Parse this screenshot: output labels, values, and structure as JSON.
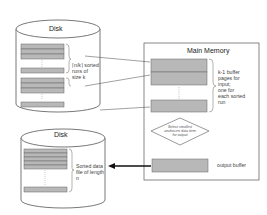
{
  "diagram": {
    "top_disk": {
      "label": "Disk",
      "runs_label_line1": "⌈n/k⌉ sorted",
      "runs_label_line2": "runs of",
      "runs_label_line3": "size k"
    },
    "bottom_disk": {
      "label": "Disk",
      "output_label_line1": "Sorted data",
      "output_label_line2": "file of length",
      "output_label_line3": "n"
    },
    "main_memory": {
      "title": "Main Memory",
      "input_buffers_label": [
        "k-1 buffer",
        "pages for",
        "input;",
        "one for",
        "each sorted",
        "run"
      ],
      "decision_text": [
        "Select smallest",
        "unchosen data item",
        "for output"
      ],
      "output_buffer_label": "output buffer"
    },
    "colors": {
      "block_fill": "#b8b8b8",
      "block_stroke": "#666666",
      "line": "#444444",
      "arrow": "#111111"
    }
  }
}
